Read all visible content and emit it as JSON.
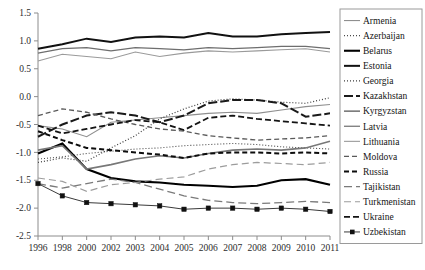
{
  "chart_data": {
    "type": "line",
    "title": "",
    "xlabel": "",
    "ylabel": "",
    "grid": false,
    "legend_position": "right",
    "x": [
      1996,
      1998,
      2000,
      2002,
      2003,
      2004,
      2005,
      2006,
      2007,
      2008,
      2009,
      2010,
      2011
    ],
    "xticklabels": [
      "1996",
      "1998",
      "2000",
      "2002",
      "2003",
      "2004",
      "2005",
      "2006",
      "2007",
      "2008",
      "2009",
      "2010",
      "2011"
    ],
    "ylim": [
      -2.5,
      1.5
    ],
    "yticks": [
      -2.5,
      -2.0,
      -1.5,
      -1.0,
      -0.5,
      0.0,
      0.5,
      1.0,
      1.5
    ],
    "yticklabels": [
      "-2.5",
      "-2.0",
      "-1.5",
      "-1.0",
      "-0.5",
      "0.0",
      "0.5",
      "1.0",
      "1.5"
    ],
    "series": [
      {
        "name": "Armenia",
        "style": "solid-thin-gray",
        "color": "#8f8f8f",
        "width": 1.1,
        "dash": "none",
        "values": [
          -0.52,
          -0.58,
          -0.72,
          -0.46,
          -0.42,
          -0.38,
          -0.34,
          -0.3,
          -0.28,
          -0.3,
          -0.24,
          -0.18,
          -0.14
        ]
      },
      {
        "name": "Azerbaijan",
        "style": "dotted-fine",
        "color": "#4a4a4a",
        "width": 1.1,
        "dash": "1,2",
        "values": [
          -1.12,
          -1.08,
          -1.02,
          -0.98,
          -0.94,
          -0.92,
          -0.88,
          -0.86,
          -0.84,
          -0.86,
          -0.9,
          -0.92,
          -0.94
        ]
      },
      {
        "name": "Belarus",
        "style": "solid-thick-black",
        "color": "#000000",
        "width": 2.1,
        "dash": "none",
        "values": [
          -1.02,
          -0.84,
          -1.3,
          -1.46,
          -1.52,
          -1.54,
          -1.58,
          -1.6,
          -1.62,
          -1.6,
          -1.5,
          -1.48,
          -1.58
        ]
      },
      {
        "name": "Estonia",
        "style": "solid-thick-black",
        "color": "#111111",
        "width": 2.0,
        "dash": "none",
        "values": [
          0.86,
          0.94,
          1.04,
          0.98,
          1.06,
          1.08,
          1.06,
          1.14,
          1.08,
          1.08,
          1.12,
          1.14,
          1.16
        ]
      },
      {
        "name": "Georgia",
        "style": "dotted-fine",
        "color": "#3c3c3c",
        "width": 1.2,
        "dash": "1,2",
        "values": [
          -1.18,
          -1.1,
          -1.16,
          -0.92,
          -0.7,
          -0.4,
          -0.22,
          -0.08,
          -0.04,
          -0.06,
          -0.1,
          -0.12,
          -0.02
        ]
      },
      {
        "name": "Kazakhstan",
        "style": "dashdot-thick",
        "color": "#1a1a1a",
        "width": 2.0,
        "dash": "9,3",
        "values": [
          -0.72,
          -0.5,
          -0.34,
          -0.28,
          -0.34,
          -0.46,
          -0.34,
          -0.12,
          -0.06,
          -0.06,
          -0.12,
          -0.36,
          -0.3
        ]
      },
      {
        "name": "Kyrgyzstan",
        "style": "solid-medium-gray",
        "color": "#787878",
        "width": 1.6,
        "dash": "none",
        "values": [
          -0.96,
          -0.88,
          -1.3,
          -1.22,
          -1.12,
          -1.06,
          -1.1,
          -1.02,
          -0.96,
          -0.94,
          -0.96,
          -0.92,
          -0.8
        ]
      },
      {
        "name": "Latvia",
        "style": "solid-gray",
        "color": "#6e6e6e",
        "width": 1.2,
        "dash": "none",
        "values": [
          0.78,
          0.86,
          0.88,
          0.82,
          0.88,
          0.86,
          0.84,
          0.88,
          0.86,
          0.88,
          0.9,
          0.9,
          0.86
        ]
      },
      {
        "name": "Lithuania",
        "style": "solid-light-gray",
        "color": "#9a9a9a",
        "width": 1.1,
        "dash": "none",
        "values": [
          0.64,
          0.76,
          0.72,
          0.68,
          0.8,
          0.72,
          0.78,
          0.82,
          0.8,
          0.82,
          0.84,
          0.86,
          0.8
        ]
      },
      {
        "name": "Moldova",
        "style": "dashed-medium",
        "color": "#5a5a5a",
        "width": 1.3,
        "dash": "5,3",
        "values": [
          -0.34,
          -0.22,
          -0.28,
          -0.4,
          -0.5,
          -0.58,
          -0.62,
          -0.7,
          -0.74,
          -0.78,
          -0.76,
          -0.74,
          -0.7
        ]
      },
      {
        "name": "Russia",
        "style": "dashed-thick-black",
        "color": "#0d0d0d",
        "width": 2.0,
        "dash": "5,3",
        "values": [
          -0.62,
          -0.78,
          -0.92,
          -0.96,
          -1.0,
          -1.04,
          -1.1,
          -1.02,
          -1.0,
          -1.0,
          -1.02,
          -1.0,
          -1.02
        ]
      },
      {
        "name": "Tajikistan",
        "style": "longdash-gray",
        "color": "#7a7a7a",
        "width": 1.3,
        "dash": "8,4",
        "values": [
          -1.56,
          -1.64,
          -1.56,
          -1.48,
          -1.54,
          -1.66,
          -1.78,
          -1.86,
          -1.9,
          -1.92,
          -1.9,
          -1.88,
          -1.9
        ]
      },
      {
        "name": "Turkmenistan",
        "style": "dash-light-gray",
        "color": "#9c9c9c",
        "width": 1.2,
        "dash": "7,4",
        "values": [
          -1.46,
          -1.52,
          -1.7,
          -1.58,
          -1.54,
          -1.48,
          -1.44,
          -1.3,
          -1.22,
          -1.18,
          -1.2,
          -1.22,
          -1.18
        ]
      },
      {
        "name": "Ukraine",
        "style": "dashdot-black",
        "color": "#141414",
        "width": 1.8,
        "dash": "6,3",
        "values": [
          -0.52,
          -0.66,
          -0.58,
          -0.5,
          -0.42,
          -0.46,
          -0.6,
          -0.38,
          -0.34,
          -0.4,
          -0.44,
          -0.48,
          -0.52
        ]
      },
      {
        "name": "Uzbekistan",
        "style": "solid-marker-square",
        "color": "#3a3a3a",
        "width": 1.0,
        "dash": "none",
        "marker": "square",
        "values": [
          -1.56,
          -1.78,
          -1.9,
          -1.92,
          -1.94,
          -1.96,
          -2.02,
          -2.0,
          -2.0,
          -2.02,
          -2.0,
          -2.02,
          -2.06
        ]
      }
    ]
  },
  "legend": {
    "items": [
      {
        "label": "Armenia"
      },
      {
        "label": "Azerbaijan"
      },
      {
        "label": "Belarus"
      },
      {
        "label": "Estonia"
      },
      {
        "label": "Georgia"
      },
      {
        "label": "Kazakhstan"
      },
      {
        "label": "Kyrgyzstan"
      },
      {
        "label": "Latvia"
      },
      {
        "label": "Lithuania"
      },
      {
        "label": "Moldova"
      },
      {
        "label": "Russia"
      },
      {
        "label": "Tajikistan"
      },
      {
        "label": "Turkmenistan"
      },
      {
        "label": "Ukraine"
      },
      {
        "label": "Uzbekistan"
      }
    ]
  },
  "colors": {
    "axis": "#8c8c8c",
    "text": "#2b2b2b",
    "background": "#ffffff",
    "legend_border": "#9a9a9a"
  }
}
